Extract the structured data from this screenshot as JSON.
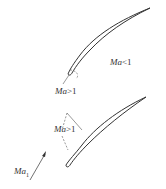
{
  "diagram": {
    "top_blade": {
      "label_subsonic": {
        "var": "Ma",
        "op": "<1"
      },
      "label_supersonic": {
        "var": "Ma",
        "op": ">1"
      }
    },
    "bottom_blade": {
      "label_supersonic": {
        "var": "Ma",
        "op": ">1"
      }
    },
    "inflow": {
      "var": "Ma",
      "sub": "1"
    },
    "colors": {
      "stroke": "#333333",
      "dashed": "#555555"
    }
  }
}
